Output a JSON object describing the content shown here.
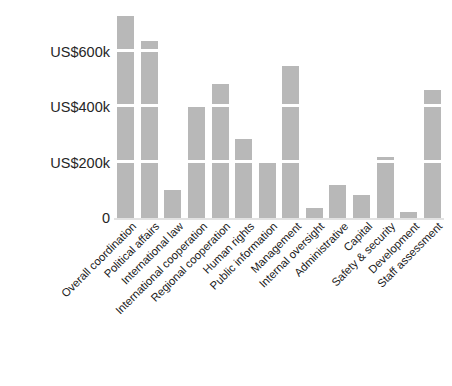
{
  "chart_data": {
    "type": "bar",
    "title": "",
    "subtitle": "",
    "xlabel": "",
    "ylabel": "",
    "categories": [
      "Overall coordination",
      "Political affairs",
      "International law",
      "International cooperation",
      "Regional cooperation",
      "Human rights",
      "Public information",
      "Management",
      "Internal oversight",
      "Administrative",
      "Capital",
      "Safety & security",
      "Development",
      "Staff assessment"
    ],
    "values": [
      730000,
      640000,
      100000,
      405000,
      485000,
      285000,
      205000,
      550000,
      38000,
      118000,
      85000,
      220000,
      22000,
      465000
    ],
    "ylim": [
      0,
      760000
    ],
    "yticks": [
      0,
      200000,
      400000,
      600000
    ],
    "ytick_labels": [
      "0",
      "US$200k",
      "US$400k",
      "US$600k"
    ],
    "grid": true,
    "grid_color": "#ffffff",
    "grid_axis": "y",
    "bar_color": "#b8b8b8",
    "legend": null,
    "legend_position": "none",
    "annotations": [],
    "xtick_rotation": -45
  }
}
